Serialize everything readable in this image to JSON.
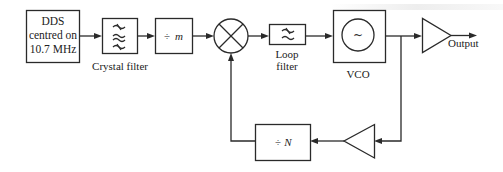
{
  "diagram": {
    "type": "block-diagram",
    "blocks": {
      "dds": {
        "lines": [
          "DDS",
          "centred on",
          "10.7 MHz"
        ]
      },
      "crystal_filter": {
        "symbol": "≈",
        "label": "Crystal filter"
      },
      "divide_m": {
        "symbol": "÷",
        "var": "m"
      },
      "mixer": {
        "symbol": "⊗"
      },
      "loop_filter": {
        "symbol": "≈",
        "label_lines": [
          "Loop",
          "filter"
        ]
      },
      "vco": {
        "symbol": "~",
        "label": "VCO"
      },
      "output_amp": {
        "label": "Output"
      },
      "divide_n": {
        "symbol": "÷",
        "var": "N"
      },
      "feedback_amp": {}
    },
    "connections": [
      [
        "dds",
        "crystal_filter"
      ],
      [
        "crystal_filter",
        "divide_m"
      ],
      [
        "divide_m",
        "mixer"
      ],
      [
        "mixer",
        "loop_filter"
      ],
      [
        "loop_filter",
        "vco"
      ],
      [
        "vco",
        "output_amp"
      ],
      [
        "output_amp",
        "output"
      ],
      [
        "vco",
        "feedback_amp"
      ],
      [
        "feedback_amp",
        "divide_n"
      ],
      [
        "divide_n",
        "mixer"
      ]
    ],
    "colors": {
      "line": "#2a2a2a",
      "background": "#ffffff"
    }
  }
}
